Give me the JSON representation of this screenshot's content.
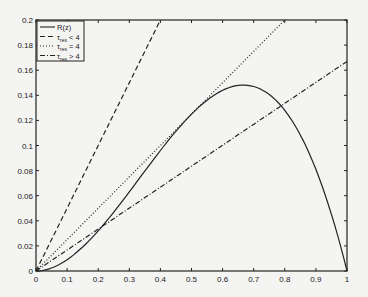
{
  "chart_data": {
    "type": "line",
    "title": "",
    "xlabel": "",
    "ylabel": "",
    "xlim": [
      0,
      1
    ],
    "ylim": [
      0,
      0.2
    ],
    "grid": false,
    "legend_position": "upper-left",
    "xticks": [
      "0",
      "0.1",
      "0.2",
      "0.3",
      "0.4",
      "0.5",
      "0.6",
      "0.7",
      "0.8",
      "0.9",
      "1"
    ],
    "yticks": [
      "0",
      "0.02",
      "0.04",
      "0.06",
      "0.08",
      "0.1",
      "0.12",
      "0.14",
      "0.16",
      "0.18",
      "0.2"
    ],
    "series": [
      {
        "name": "R(z)",
        "style": "solid",
        "x": [
          0,
          0.1,
          0.2,
          0.3,
          0.4,
          0.5,
          0.6,
          0.667,
          0.7,
          0.8,
          0.9,
          1
        ],
        "values": [
          0,
          0.009,
          0.032,
          0.063,
          0.096,
          0.125,
          0.144,
          0.148,
          0.147,
          0.128,
          0.081,
          0
        ]
      },
      {
        "name": "τ_res < 4",
        "style": "dashed",
        "x": [
          0,
          0.4
        ],
        "values": [
          0,
          0.2
        ]
      },
      {
        "name": "τ_res = 4",
        "style": "dotted",
        "x": [
          0,
          0.8
        ],
        "values": [
          0,
          0.2
        ]
      },
      {
        "name": "τ_res > 4",
        "style": "dash-dot",
        "x": [
          0,
          1
        ],
        "values": [
          0,
          0.167
        ]
      }
    ]
  },
  "legend": {
    "items": [
      {
        "label": "R(z)",
        "main": "R(z)",
        "sub": "",
        "rel": ""
      },
      {
        "label": "τres < 4",
        "main": "τ",
        "sub": "res",
        "rel": " < 4"
      },
      {
        "label": "τres = 4",
        "main": "τ",
        "sub": "res",
        "rel": " = 4"
      },
      {
        "label": "τres > 4",
        "main": "τ",
        "sub": "res",
        "rel": " > 4"
      }
    ]
  }
}
